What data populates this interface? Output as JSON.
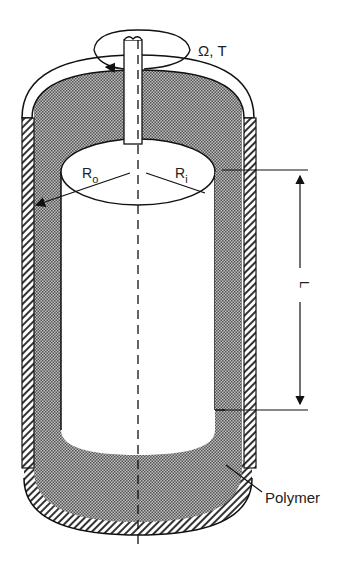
{
  "diagram": {
    "type": "concentric-cylinder-rheometer",
    "labels": {
      "rotation": "Ω, T",
      "outer_radius_main": "R",
      "outer_radius_sub": "o",
      "inner_radius_main": "R",
      "inner_radius_sub": "i",
      "length": "L",
      "material": "Polymer"
    },
    "colors": {
      "stroke": "#111111",
      "background": "#ffffff",
      "polymer_fill": "#8a8a8a",
      "hatch": "#333333"
    }
  }
}
